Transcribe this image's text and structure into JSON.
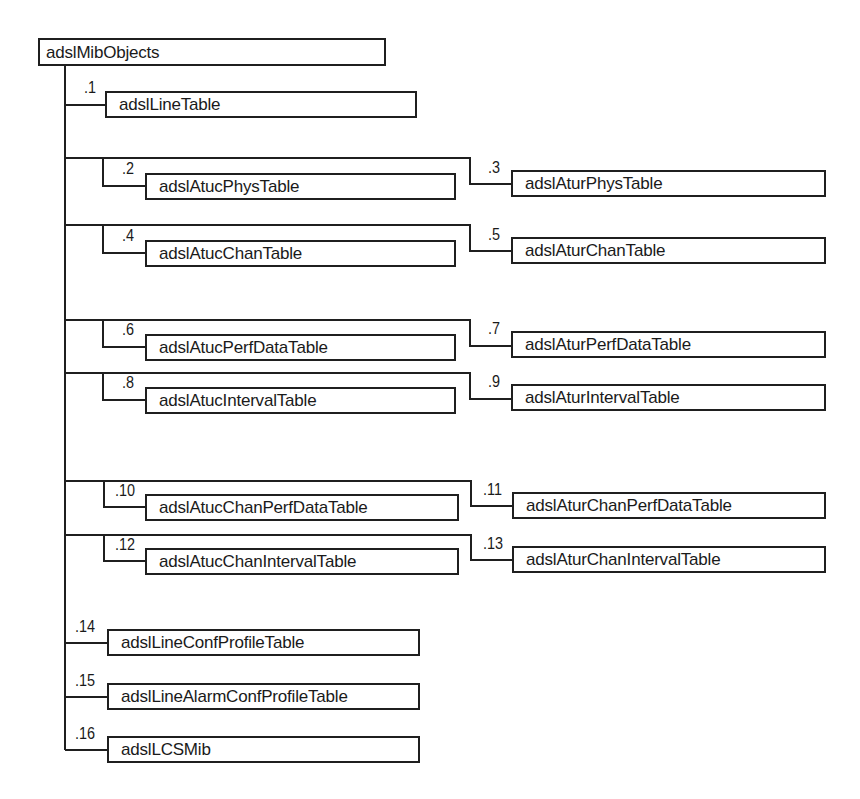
{
  "diagram": {
    "title": "adslMibObjects",
    "root": {
      "label": "adslMibObjects"
    },
    "nodes": [
      {
        "oid": ".1",
        "label": "adslLineTable"
      },
      {
        "oid": ".2",
        "label": "adslAtucPhysTable"
      },
      {
        "oid": ".3",
        "label": "adslAturPhysTable"
      },
      {
        "oid": ".4",
        "label": "adslAtucChanTable"
      },
      {
        "oid": ".5",
        "label": "adslAturChanTable"
      },
      {
        "oid": ".6",
        "label": "adslAtucPerfDataTable"
      },
      {
        "oid": ".7",
        "label": "adslAturPerfDataTable"
      },
      {
        "oid": ".8",
        "label": "adslAtucIntervalTable"
      },
      {
        "oid": ".9",
        "label": "adslAturIntervalTable"
      },
      {
        "oid": ".10",
        "label": "adslAtucChanPerfDataTable"
      },
      {
        "oid": ".11",
        "label": "adslAturChanPerfDataTable"
      },
      {
        "oid": ".12",
        "label": "adslAtucChanIntervalTable"
      },
      {
        "oid": ".13",
        "label": "adslAturChanIntervalTable"
      },
      {
        "oid": ".14",
        "label": "adslLineConfProfileTable"
      },
      {
        "oid": ".15",
        "label": "adslLineAlarmConfProfileTable"
      },
      {
        "oid": ".16",
        "label": "adslLCSMib"
      }
    ],
    "colors": {
      "line": "#1f1f1f",
      "background": "#ffffff",
      "text": "#1a1a1a"
    }
  }
}
